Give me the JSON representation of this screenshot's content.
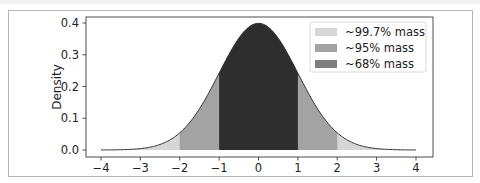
{
  "chart_data": {
    "type": "area",
    "title": "",
    "xlabel": "",
    "ylabel": "Density",
    "xlim": [
      -4,
      4
    ],
    "ylim": [
      0,
      0.4
    ],
    "x_ticks": [
      "−4",
      "−3",
      "−2",
      "−1",
      "0",
      "1",
      "2",
      "3",
      "4"
    ],
    "y_ticks": [
      "0.0",
      "0.1",
      "0.2",
      "0.3",
      "0.4"
    ],
    "grid": false,
    "legend_position": "upper right",
    "distribution": "standard normal (mean 0, sd 1)",
    "curve": {
      "x": [
        -4,
        -3,
        -2,
        -1,
        0,
        1,
        2,
        3,
        4
      ],
      "y": [
        0.0001,
        0.0044,
        0.054,
        0.242,
        0.399,
        0.242,
        0.054,
        0.0044,
        0.0001
      ]
    },
    "series": [
      {
        "name": "~99.7% mass",
        "range": [
          -3,
          3
        ],
        "color": "#d3d3d3"
      },
      {
        "name": "~95% mass",
        "range": [
          -2,
          2
        ],
        "color": "#a0a0a0"
      },
      {
        "name": "~68% mass",
        "range": [
          -1,
          1
        ],
        "color": "#303030"
      }
    ]
  },
  "legend": {
    "items": [
      {
        "label": "~99.7% mass",
        "color": "#d3d3d3"
      },
      {
        "label": "~95% mass",
        "color": "#a0a0a0"
      },
      {
        "label": "~68% mass",
        "color": "#303030"
      }
    ]
  },
  "axes": {
    "ylabel": "Density",
    "x_ticks": [
      "−4",
      "−3",
      "−2",
      "−1",
      "0",
      "1",
      "2",
      "3",
      "4"
    ],
    "y_ticks": [
      "0.0",
      "0.1",
      "0.2",
      "0.3",
      "0.4"
    ]
  }
}
